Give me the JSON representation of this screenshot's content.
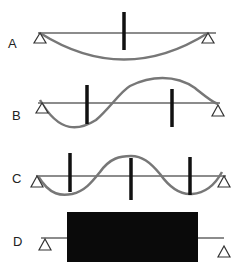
{
  "colors": {
    "beam": "#666666",
    "curve": "#7a7a7a",
    "bar": "#111111",
    "support": "#333333",
    "block": "#0a0a0a"
  },
  "panels": [
    {
      "id": "A",
      "label": "A",
      "description": "First mode: single half-wave with one stiffener at midspan"
    },
    {
      "id": "B",
      "label": "B",
      "description": "Second mode: full sine wave with two stiffeners at antinodes"
    },
    {
      "id": "C",
      "label": "C",
      "description": "Third mode: one and a half waves with three stiffeners at antinodes"
    },
    {
      "id": "D",
      "label": "D",
      "description": "Fully filled/blocked span between supports"
    }
  ]
}
